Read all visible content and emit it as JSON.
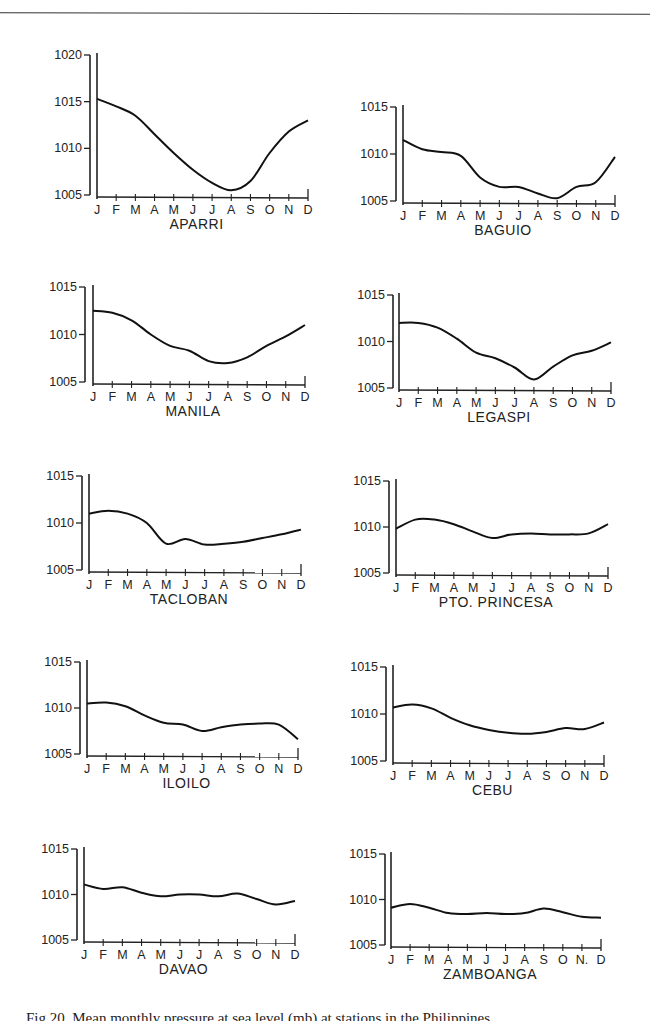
{
  "figure": {
    "caption": "Fig.20. Mean monthly pressure at sea level (mb) at stations in the Philippines"
  },
  "chart_data": [
    {
      "type": "line",
      "title": "APARRI",
      "xlabel": "",
      "ylabel": "",
      "categories": [
        "J",
        "F",
        "M",
        "A",
        "M",
        "J",
        "J",
        "A",
        "S",
        "O",
        "N",
        "D"
      ],
      "yticks": [
        1005,
        1010,
        1015,
        1020
      ],
      "ylim": [
        1005,
        1020
      ],
      "grid": false,
      "values": [
        1015.3,
        1014.5,
        1013.5,
        1011.5,
        1009.5,
        1007.7,
        1006.3,
        1005.5,
        1006.5,
        1009.5,
        1011.8,
        1013.0
      ]
    },
    {
      "type": "line",
      "title": "BAGUIO",
      "xlabel": "",
      "ylabel": "",
      "categories": [
        "J",
        "F",
        "M",
        "A",
        "M",
        "J",
        "J",
        "A",
        "S",
        "O",
        "N",
        "D"
      ],
      "yticks": [
        1005,
        1010,
        1015
      ],
      "ylim": [
        1005,
        1015
      ],
      "grid": false,
      "values": [
        1011.5,
        1010.5,
        1010.2,
        1009.8,
        1007.5,
        1006.5,
        1006.5,
        1005.8,
        1005.3,
        1006.5,
        1007.0,
        1009.7
      ]
    },
    {
      "type": "line",
      "title": "MANILA",
      "xlabel": "",
      "ylabel": "",
      "categories": [
        "J",
        "F",
        "M",
        "A",
        "M",
        "J",
        "J",
        "A",
        "S",
        "O",
        "N",
        "D"
      ],
      "yticks": [
        1005,
        1010,
        1015
      ],
      "ylim": [
        1005,
        1015
      ],
      "grid": false,
      "values": [
        1012.5,
        1012.3,
        1011.5,
        1010.0,
        1008.8,
        1008.3,
        1007.2,
        1007.0,
        1007.6,
        1008.8,
        1009.8,
        1011.0
      ]
    },
    {
      "type": "line",
      "title": "LEGASPI",
      "xlabel": "",
      "ylabel": "",
      "categories": [
        "J",
        "F",
        "M",
        "A",
        "M",
        "J",
        "J",
        "A",
        "S",
        "O",
        "N",
        "D"
      ],
      "yticks": [
        1005,
        1010,
        1015
      ],
      "ylim": [
        1005,
        1015
      ],
      "grid": false,
      "values": [
        1012.0,
        1012.0,
        1011.5,
        1010.3,
        1008.8,
        1008.2,
        1007.2,
        1005.9,
        1007.3,
        1008.5,
        1009.0,
        1009.9
      ]
    },
    {
      "type": "line",
      "title": "TACLOBAN",
      "xlabel": "",
      "ylabel": "",
      "categories": [
        "J",
        "F",
        "M",
        "A",
        "M",
        "J",
        "J",
        "A",
        "S",
        "O",
        "N",
        "D"
      ],
      "yticks": [
        1005,
        1010,
        1015
      ],
      "ylim": [
        1005,
        1015
      ],
      "grid": false,
      "values": [
        1011.0,
        1011.3,
        1011.0,
        1010.0,
        1007.8,
        1008.3,
        1007.7,
        1007.8,
        1008.0,
        1008.4,
        1008.8,
        1009.3
      ]
    },
    {
      "type": "line",
      "title": "PTO. PRINCESA",
      "xlabel": "",
      "ylabel": "",
      "categories": [
        "J",
        "F",
        "M",
        "A",
        "M",
        "J",
        "J",
        "A",
        "S",
        "O",
        "N",
        "D"
      ],
      "yticks": [
        1005,
        1010,
        1015
      ],
      "ylim": [
        1005,
        1015
      ],
      "grid": false,
      "values": [
        1009.8,
        1010.8,
        1010.8,
        1010.3,
        1009.5,
        1008.8,
        1009.2,
        1009.3,
        1009.2,
        1009.2,
        1009.3,
        1010.3
      ]
    },
    {
      "type": "line",
      "title": "ILOILO",
      "xlabel": "",
      "ylabel": "",
      "categories": [
        "J",
        "F",
        "M",
        "A",
        "M",
        "J",
        "J",
        "A",
        "S",
        "O",
        "N",
        "D"
      ],
      "yticks": [
        1005,
        1010,
        1015
      ],
      "ylim": [
        1005,
        1015
      ],
      "grid": false,
      "values": [
        1010.5,
        1010.6,
        1010.2,
        1009.2,
        1008.4,
        1008.2,
        1007.5,
        1007.9,
        1008.2,
        1008.3,
        1008.2,
        1006.6
      ]
    },
    {
      "type": "line",
      "title": "CEBU",
      "xlabel": "",
      "ylabel": "",
      "categories": [
        "J",
        "F",
        "M",
        "A",
        "M",
        "J",
        "J",
        "A",
        "S",
        "O",
        "N",
        "D"
      ],
      "yticks": [
        1005,
        1010,
        1015
      ],
      "ylim": [
        1005,
        1015
      ],
      "grid": false,
      "values": [
        1010.7,
        1011.0,
        1010.6,
        1009.6,
        1008.8,
        1008.3,
        1008.0,
        1007.9,
        1008.1,
        1008.5,
        1008.4,
        1009.1
      ]
    },
    {
      "type": "line",
      "title": "DAVAO",
      "xlabel": "",
      "ylabel": "",
      "categories": [
        "J",
        "F",
        "M",
        "A",
        "M",
        "J",
        "J",
        "A",
        "S",
        "O",
        "N",
        "D"
      ],
      "yticks": [
        1005,
        1010,
        1015
      ],
      "ylim": [
        1005,
        1015
      ],
      "grid": false,
      "values": [
        1011.1,
        1010.6,
        1010.8,
        1010.2,
        1009.8,
        1010.0,
        1010.0,
        1009.8,
        1010.1,
        1009.5,
        1008.9,
        1009.3
      ]
    },
    {
      "type": "line",
      "title": "ZAMBOANGA",
      "xlabel": "",
      "ylabel": "",
      "categories": [
        "J",
        "F",
        "M",
        "A",
        "M",
        "J",
        "J",
        "A",
        "S",
        "O",
        "N.",
        "D"
      ],
      "yticks": [
        1005,
        1010,
        1015
      ],
      "ylim": [
        1005,
        1015
      ],
      "grid": false,
      "values": [
        1009.1,
        1009.5,
        1009.1,
        1008.5,
        1008.4,
        1008.5,
        1008.4,
        1008.5,
        1009.0,
        1008.6,
        1008.1,
        1008.0
      ]
    }
  ],
  "layout": [
    {
      "axis_x": 90,
      "plot_left": 97,
      "plot_right": 308,
      "y_top_val": 1020,
      "y_top": 55,
      "y_bottom": 195
    },
    {
      "axis_x": 396,
      "plot_left": 403,
      "plot_right": 615,
      "y_top_val": 1015,
      "y_top": 107,
      "y_bottom": 201
    },
    {
      "axis_x": 85,
      "plot_left": 93,
      "plot_right": 305,
      "y_top_val": 1015,
      "y_top": 287,
      "y_bottom": 382
    },
    {
      "axis_x": 393,
      "plot_left": 399,
      "plot_right": 611,
      "y_top_val": 1015,
      "y_top": 295,
      "y_bottom": 388
    },
    {
      "axis_x": 82,
      "plot_left": 89,
      "plot_right": 301,
      "y_top_val": 1015,
      "y_top": 476,
      "y_bottom": 570
    },
    {
      "axis_x": 389,
      "plot_left": 396,
      "plot_right": 608,
      "y_top_val": 1015,
      "y_top": 481,
      "y_bottom": 573
    },
    {
      "axis_x": 80,
      "plot_left": 87,
      "plot_right": 298,
      "y_top_val": 1015,
      "y_top": 662,
      "y_bottom": 754
    },
    {
      "axis_x": 386,
      "plot_left": 393,
      "plot_right": 604,
      "y_top_val": 1015,
      "y_top": 667,
      "y_bottom": 761
    },
    {
      "axis_x": 77,
      "plot_left": 84,
      "plot_right": 295,
      "y_top_val": 1015,
      "y_top": 849,
      "y_bottom": 940
    },
    {
      "axis_x": 385,
      "plot_left": 391,
      "plot_right": 601,
      "y_top_val": 1015,
      "y_top": 854,
      "y_bottom": 945
    }
  ]
}
